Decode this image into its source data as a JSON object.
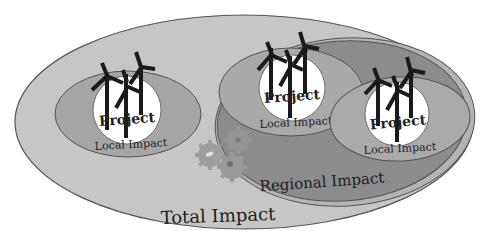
{
  "diagram": {
    "title": "Total Impact",
    "regions": {
      "total": {
        "label": "Total Impact",
        "color": "#c4c4c4"
      },
      "regional": {
        "label": "Regional Impact",
        "color": "#8a8a8a"
      },
      "local": {
        "label": "Local Impact",
        "color": "#a9a9a9"
      },
      "project": {
        "label": "Project",
        "color": "#ffffff"
      }
    },
    "projects": [
      {
        "project_label": "Project",
        "local_label": "Local Impact",
        "group": "standalone"
      },
      {
        "project_label": "Project",
        "local_label": "Local Impact",
        "group": "regional"
      },
      {
        "project_label": "Project",
        "local_label": "Local Impact",
        "group": "regional"
      }
    ],
    "icons": {
      "turbine": "wind-turbine-icon",
      "gears": "gears-icon"
    },
    "gear_color": "#9a9a9a"
  }
}
